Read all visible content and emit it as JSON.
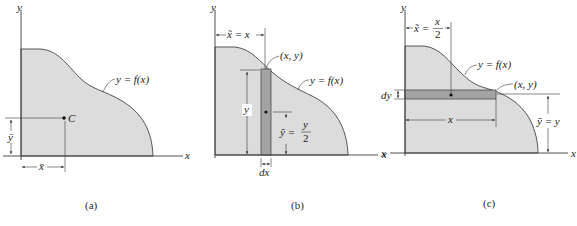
{
  "colors": {
    "region_fill": "#dcdcdc",
    "strip_fill": "#a3a3a3",
    "line": "#3a3a3a",
    "background": "#ffffff"
  },
  "panels": [
    {
      "id": "a",
      "caption": "(a)",
      "axis_x_label": "x",
      "axis_y_label": "y",
      "curve_label": "y = f(x)",
      "centroid_label": "C",
      "xbar_label": "x̄",
      "ybar_label": "ȳ"
    },
    {
      "id": "b",
      "caption": "(b)",
      "axis_x_label": "x",
      "axis_y_label": "y",
      "curve_label": "y = f(x)",
      "point_label": "(x, y)",
      "xtilde_label": "x̃ = x",
      "height_label": "y",
      "ytilde_label_lhs": "ỹ =",
      "ytilde_num": "y",
      "ytilde_den": "2",
      "width_label": "dx"
    },
    {
      "id": "c",
      "caption": "(c)",
      "axis_x_label": "x",
      "axis_y_label": "y",
      "curve_label": "y = f(x)",
      "point_label": "(x, y)",
      "xtilde_label_lhs": "x̃ =",
      "xtilde_num": "x",
      "xtilde_den": "2",
      "length_label": "x",
      "ytilde_label": "ỹ = y",
      "thickness_label": "dy"
    }
  ]
}
